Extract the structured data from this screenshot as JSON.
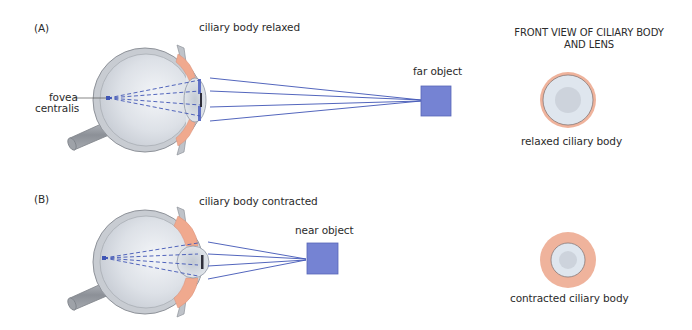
{
  "figure": {
    "panels": [
      {
        "id": "A",
        "label": "(A)",
        "ciliary_state_label": "ciliary body relaxed",
        "object_label": "far object",
        "fovea_label_line1": "fovea",
        "fovea_label_line2": "centralis",
        "front_view_caption": "relaxed ciliary body"
      },
      {
        "id": "B",
        "label": "(B)",
        "ciliary_state_label": "ciliary body contracted",
        "object_label": "near object",
        "front_view_caption": "contracted ciliary body"
      }
    ],
    "front_view_heading_line1": "FRONT VIEW OF CILIARY BODY",
    "front_view_heading_line2": "AND LENS"
  },
  "colors": {
    "eye_wall": "#c9ccd1",
    "eye_outline": "#8e9299",
    "vitreous": "#dfe3e8",
    "ciliary_body": "#f0a98e",
    "lens": "#d9dee5",
    "ray": "#3f55b5",
    "object": "#7583d3",
    "object_border": "#5766b8",
    "front_ring": "#efb39c",
    "front_lens": "#dde3ea"
  }
}
